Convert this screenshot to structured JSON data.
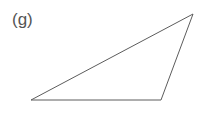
{
  "figure": {
    "label": "(g)",
    "background_color": "#ffffff",
    "width": 209,
    "height": 116
  },
  "chart_data": {
    "type": "scatter",
    "title": "(g)",
    "subtitle": "",
    "xlabel": "",
    "ylabel": "",
    "grid": false,
    "legend_position": "none",
    "annotations": [
      "(g)"
    ],
    "shapes": [
      {
        "name": "triangle",
        "kind": "polygon",
        "closed": true,
        "vertices": [
          {
            "label": "bottom-left",
            "x": 31,
            "y": 100
          },
          {
            "label": "apex-right",
            "x": 193,
            "y": 14
          },
          {
            "label": "bottom-right",
            "x": 161,
            "y": 100
          }
        ],
        "stroke_color": "#5c5c5c",
        "stroke_width": 1,
        "fill": "none"
      }
    ],
    "x": [
      31,
      193,
      161
    ],
    "values": [
      100,
      14,
      100
    ],
    "categories": [
      "bottom-left",
      "apex-right",
      "bottom-right"
    ],
    "xlim": [
      0,
      209
    ],
    "ylim": [
      0,
      116
    ]
  }
}
